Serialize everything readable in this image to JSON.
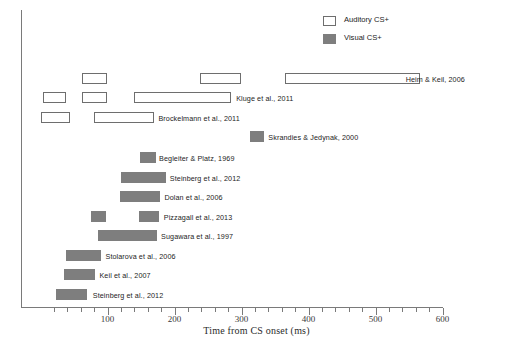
{
  "chart_data": {
    "type": "bar",
    "orientation": "horizontal",
    "title": "",
    "xlabel": "Time from CS onset (ms)",
    "ylabel": "",
    "xlim": [
      0,
      620
    ],
    "xticks": [
      100,
      200,
      300,
      400,
      500,
      600
    ],
    "xtick_labels": [
      "100",
      "200",
      "300",
      "400",
      "500",
      "600"
    ],
    "minor_tick_step": 20,
    "grid": false,
    "legend": {
      "position": "top-right",
      "entries": [
        {
          "label": "Auditory CS+",
          "swatch": "auditory",
          "color": "#ffffff"
        },
        {
          "label": "Visual CS+",
          "swatch": "visual",
          "color": "#7e7e7e"
        }
      ]
    },
    "rows": [
      {
        "label": "Heim & Keil, 2006",
        "type": "auditory",
        "label_x": 545,
        "y": 73,
        "intervals": [
          {
            "start": 62,
            "end": 100
          },
          {
            "start": 238,
            "end": 300
          },
          {
            "start": 365,
            "end": 566
          }
        ]
      },
      {
        "label": "Kluge et al., 2011",
        "type": "auditory",
        "label_x": 292,
        "y": 92,
        "intervals": [
          {
            "start": 4,
            "end": 38
          },
          {
            "start": 62,
            "end": 100
          },
          {
            "start": 140,
            "end": 284
          }
        ]
      },
      {
        "label": "Brockelmann et al., 2011",
        "type": "auditory",
        "label_x": 176,
        "y": 112,
        "intervals": [
          {
            "start": 0,
            "end": 44
          },
          {
            "start": 80,
            "end": 170
          }
        ]
      },
      {
        "label": "Skrandies & Jedynak, 2000",
        "type": "visual",
        "label_x": 340,
        "y": 131,
        "intervals": [
          {
            "start": 312,
            "end": 334
          }
        ]
      },
      {
        "label": "Begleiter & Platz, 1969",
        "type": "visual",
        "label_x": 177,
        "y": 152,
        "intervals": [
          {
            "start": 148,
            "end": 172
          }
        ]
      },
      {
        "label": "Steinberg et al., 2012",
        "type": "visual",
        "label_x": 193,
        "y": 172,
        "intervals": [
          {
            "start": 120,
            "end": 188
          }
        ]
      },
      {
        "label": "Dolan et al., 2006",
        "type": "visual",
        "label_x": 185,
        "y": 191,
        "intervals": [
          {
            "start": 118,
            "end": 178
          }
        ]
      },
      {
        "label": "Pizzagall et al., 2013",
        "type": "visual",
        "label_x": 184,
        "y": 211,
        "intervals": [
          {
            "start": 75,
            "end": 98
          },
          {
            "start": 147,
            "end": 177
          }
        ]
      },
      {
        "label": "Sugawara et al., 1997",
        "type": "visual",
        "label_x": 180,
        "y": 230,
        "intervals": [
          {
            "start": 86,
            "end": 174
          }
        ]
      },
      {
        "label": "Stolarova et al., 2006",
        "type": "visual",
        "label_x": 97,
        "y": 250,
        "intervals": [
          {
            "start": 38,
            "end": 90
          }
        ]
      },
      {
        "label": "Keil et al., 2007",
        "type": "visual",
        "label_x": 88,
        "y": 269,
        "intervals": [
          {
            "start": 35,
            "end": 82
          }
        ]
      },
      {
        "label": "Steinberg et al., 2012",
        "type": "visual",
        "label_x": 78,
        "y": 289,
        "intervals": [
          {
            "start": 23,
            "end": 70
          }
        ]
      }
    ]
  }
}
